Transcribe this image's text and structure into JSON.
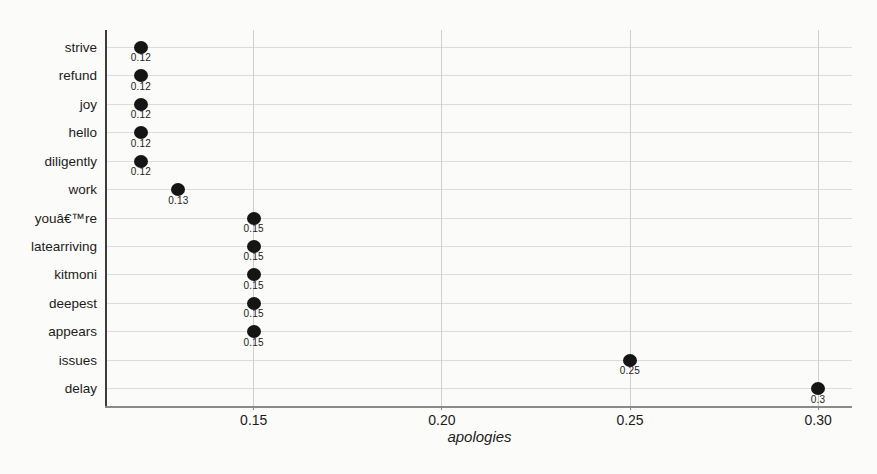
{
  "chart_data": {
    "type": "scatter",
    "variant": "horizontal-dot-plot",
    "title": "",
    "xlabel": "apologies",
    "ylabel": "",
    "categories": [
      "strive",
      "refund",
      "joy",
      "hello",
      "diligently",
      "work",
      "youâ€™re",
      "latearriving",
      "kitmoni",
      "deepest",
      "appears",
      "issues",
      "delay"
    ],
    "values": [
      0.12,
      0.12,
      0.12,
      0.12,
      0.12,
      0.13,
      0.15,
      0.15,
      0.15,
      0.15,
      0.15,
      0.25,
      0.3
    ],
    "point_labels": [
      "0.12",
      "0.12",
      "0.12",
      "0.12",
      "0.12",
      "0.13",
      "0.15",
      "0.15",
      "0.15",
      "0.15",
      "0.15",
      "0.25",
      "0.3"
    ],
    "xlim": [
      0.111,
      0.309
    ],
    "xticks": [
      0.15,
      0.2,
      0.25,
      0.3
    ],
    "xtick_labels": [
      "0.15",
      "0.20",
      "0.25",
      "0.30"
    ],
    "grid": true,
    "legend": "none",
    "colors": {
      "dot": "#151515",
      "grid_horizontal": "#dcdcda",
      "grid_vertical": "#cfcfcd",
      "axis_left": "#3c3c3c",
      "axis_bottom": "#8a8a8a",
      "text": "#1c1c1c",
      "background": "#fbfbf9"
    }
  }
}
